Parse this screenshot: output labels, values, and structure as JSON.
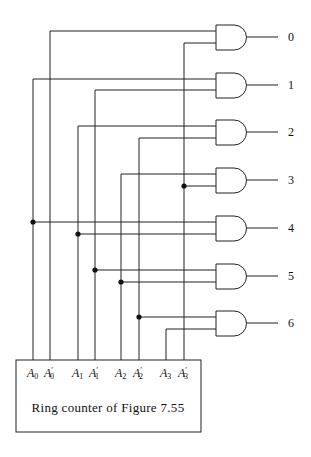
{
  "diagram": {
    "counter_box": {
      "label": "Ring counter of Figure 7.55"
    },
    "inputs": [
      {
        "name": "A0",
        "base": "A",
        "sub": "0",
        "prime": false,
        "x": 33
      },
      {
        "name": "A0'",
        "base": "A",
        "sub": "0",
        "prime": true,
        "x": 50
      },
      {
        "name": "A1",
        "base": "A",
        "sub": "1",
        "prime": false,
        "x": 78
      },
      {
        "name": "A1'",
        "base": "A",
        "sub": "1",
        "prime": true,
        "x": 95
      },
      {
        "name": "A2",
        "base": "A",
        "sub": "2",
        "prime": false,
        "x": 121
      },
      {
        "name": "A2'",
        "base": "A",
        "sub": "2",
        "prime": true,
        "x": 139
      },
      {
        "name": "A3",
        "base": "A",
        "sub": "3",
        "prime": false,
        "x": 166
      },
      {
        "name": "A3'",
        "base": "A",
        "sub": "3",
        "prime": true,
        "x": 184
      }
    ],
    "gates": [
      {
        "output": "0",
        "inputs": [
          "A0'",
          "A3'"
        ]
      },
      {
        "output": "1",
        "inputs": [
          "A0",
          "A1'"
        ]
      },
      {
        "output": "2",
        "inputs": [
          "A1",
          "A2'"
        ]
      },
      {
        "output": "3",
        "inputs": [
          "A2",
          "A3'"
        ]
      },
      {
        "output": "4",
        "inputs": [
          "A0",
          "A1"
        ]
      },
      {
        "output": "5",
        "inputs": [
          "A1'",
          "A2"
        ]
      },
      {
        "output": "6",
        "inputs": [
          "A2'",
          "A3"
        ]
      }
    ]
  }
}
